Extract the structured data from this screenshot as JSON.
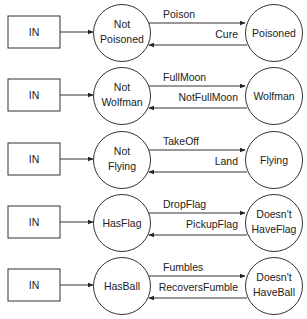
{
  "diagram": {
    "type": "state-machine-set",
    "rows": [
      {
        "input": "IN",
        "state_a": [
          "Not",
          "Poisoned"
        ],
        "state_b": [
          "Poisoned"
        ],
        "forward": "Poison",
        "backward": "Cure"
      },
      {
        "input": "IN",
        "state_a": [
          "Not",
          "Wolfman"
        ],
        "state_b": [
          "Wolfman"
        ],
        "forward": "FullMoon",
        "backward": "NotFullMoon"
      },
      {
        "input": "IN",
        "state_a": [
          "Not",
          "Flying"
        ],
        "state_b": [
          "Flying"
        ],
        "forward": "TakeOff",
        "backward": "Land"
      },
      {
        "input": "IN",
        "state_a": [
          "HasFlag"
        ],
        "state_b": [
          "Doesn't",
          "HaveFlag"
        ],
        "forward": "DropFlag",
        "backward": "PickupFlag"
      },
      {
        "input": "IN",
        "state_a": [
          "HasBall"
        ],
        "state_b": [
          "Doesn't",
          "HaveBall"
        ],
        "forward": "Fumbles",
        "backward": "RecoversFumble"
      }
    ]
  },
  "colors": {
    "stroke": "#333333",
    "text": "#222222",
    "background": "#ffffff"
  }
}
